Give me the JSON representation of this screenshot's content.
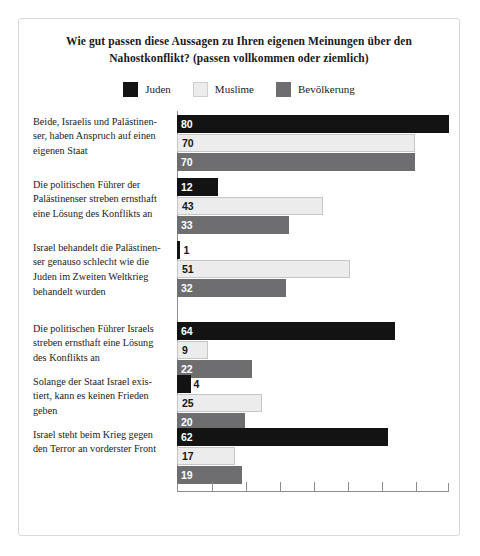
{
  "chart_data": {
    "type": "bar",
    "orientation": "horizontal",
    "title": "Wie gut passen diese Aussagen zu Ihren eigenen Meinungen über den Nahostkonflikt? (passen vollkommen oder ziemlich)",
    "title_line1": "Wie gut passen diese Aussagen zu Ihren eigenen Meinungen über den",
    "title_line2": "Nahostkonflikt? (passen vollkommen oder ziemlich)",
    "xlabel": "",
    "ylabel": "",
    "xlim": [
      0,
      80
    ],
    "xticks": [
      0,
      10,
      20,
      30,
      40,
      50,
      60,
      70,
      80
    ],
    "xtick_labels": [
      "",
      "",
      "",
      "",
      "",
      "",
      "",
      "",
      ""
    ],
    "grid": false,
    "legend_position": "top-center",
    "categories": [
      "Beide, Israelis und Palästinenser, haben Anspruch auf einen eigenen Staat",
      "Die politischen Führer der Palästinenser streben ernsthaft eine Lösung des Konflikts an",
      "Israel behandelt die Palästinenser genauso schlecht wie die Juden im Zweiten Weltkrieg behandelt wurden",
      "Die politischen Führer Israels streben ernsthaft eine Lösung des Konflikts an",
      "Solange der Staat Israel existiert, kann es keinen Frieden geben",
      "Israel steht beim Krieg gegen den Terror an vorderster Front"
    ],
    "category_lines": [
      [
        "Beide, Israelis und Palästinen-",
        "ser, haben Anspruch auf einen",
        "eigenen Staat"
      ],
      [
        "Die politischen Führer der",
        "Palästinenser streben ernsthaft",
        "eine Lösung des Konflikts an"
      ],
      [
        "Israel behandelt die Palästinen-",
        "ser genauso schlecht wie die",
        "Juden im Zweiten Weltkrieg",
        "behandelt wurden"
      ],
      [
        "Die politischen Führer Israels",
        "streben ernsthaft eine Lösung",
        "des Konflikts  an"
      ],
      [
        "Solange der Staat Israel exis-",
        "tiert, kann es keinen Frieden",
        "geben"
      ],
      [
        "Israel steht beim Krieg gegen",
        "den Terror an vorderster Front"
      ]
    ],
    "series": [
      {
        "name": "Juden",
        "color": "#131313",
        "values": [
          80,
          12,
          1,
          64,
          4,
          62
        ]
      },
      {
        "name": "Muslime",
        "color": "#ececec",
        "values": [
          70,
          43,
          51,
          9,
          25,
          17
        ]
      },
      {
        "name": "Bevölkerung",
        "color": "#6e6e70",
        "values": [
          70,
          33,
          32,
          22,
          20,
          19
        ]
      }
    ]
  },
  "legend": {
    "items": [
      {
        "label": "Juden",
        "color": "#131313"
      },
      {
        "label": "Muslime",
        "color": "#ececec"
      },
      {
        "label": "Bevölkerung",
        "color": "#6e6e70"
      }
    ]
  }
}
